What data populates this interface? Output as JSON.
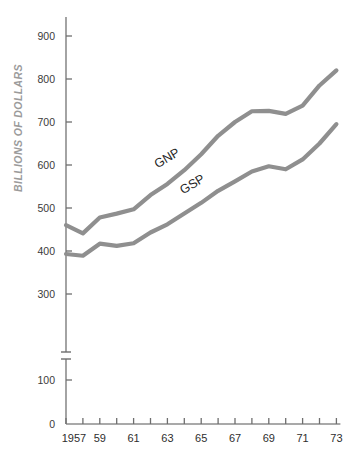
{
  "chart_data": {
    "type": "line",
    "title": "",
    "subtitle": "",
    "xlabel": "",
    "ylabel": "BILLIONS OF DOLLARS",
    "x": [
      1957,
      1958,
      1959,
      1960,
      1961,
      1962,
      1963,
      1964,
      1965,
      1966,
      1967,
      1968,
      1969,
      1970,
      1971,
      1972,
      1973
    ],
    "xtick_labels": [
      "1957",
      "",
      "59",
      "",
      "61",
      "",
      "63",
      "",
      "65",
      "",
      "67",
      "",
      "69",
      "",
      "71",
      "",
      "73"
    ],
    "xtick_years_all": [
      1957,
      1958,
      1959,
      1960,
      1961,
      1962,
      1963,
      1964,
      1965,
      1966,
      1967,
      1968,
      1969,
      1970,
      1971,
      1972,
      1973
    ],
    "ytick_labels": [
      "100",
      "300",
      "400",
      "500",
      "600",
      "700",
      "800",
      "900"
    ],
    "ytick_values": [
      100,
      300,
      400,
      500,
      600,
      700,
      800,
      900
    ],
    "ylim": [
      0,
      950
    ],
    "axis_break": {
      "present": true,
      "between": [
        100,
        300
      ]
    },
    "grid": false,
    "legend": "inline-labels",
    "series": [
      {
        "name": "GNP",
        "label": "GNP",
        "color": "#8f8f8f",
        "values": [
          460,
          441,
          478,
          487,
          497,
          530,
          556,
          588,
          625,
          668,
          700,
          725,
          726,
          719,
          738,
          785,
          820
        ]
      },
      {
        "name": "GSP",
        "label": "GSP",
        "color": "#8f8f8f",
        "values": [
          393,
          389,
          417,
          412,
          418,
          443,
          462,
          487,
          512,
          540,
          562,
          585,
          597,
          590,
          613,
          650,
          695
        ]
      }
    ],
    "annotations": [
      {
        "text": "GNP",
        "x_year": 1963.1,
        "y_value": 608,
        "rotation": -31
      },
      {
        "text": "GSP",
        "x_year": 1964.6,
        "y_value": 547,
        "rotation": -31
      }
    ],
    "colors": {
      "line": "#8f8f8f",
      "axis": "#8d8d8d",
      "tick": "#6e6e6e",
      "tick_text": "#2e2e2e",
      "axis_title": "#9b9b9b",
      "background": "#ffffff"
    },
    "zero_label": "0"
  }
}
